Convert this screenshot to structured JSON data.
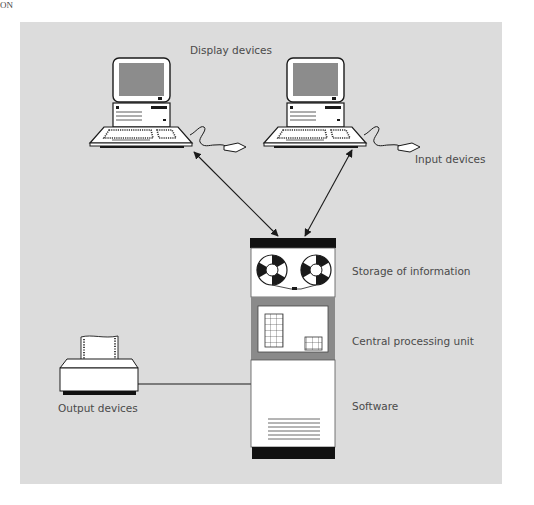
{
  "page": {
    "corner_text": "ON"
  },
  "diagram": {
    "labels": {
      "display_devices": "Display devices",
      "input_devices": "Input devices",
      "storage": "Storage of information",
      "cpu": "Central processing unit",
      "software": "Software",
      "output_devices": "Output devices"
    },
    "colors": {
      "panel_background": "#dcdcdc",
      "line": "#1a1a1a",
      "screen": "#8c8c8c",
      "cpu_frame": "#8a8a8a",
      "white": "#ffffff"
    }
  }
}
